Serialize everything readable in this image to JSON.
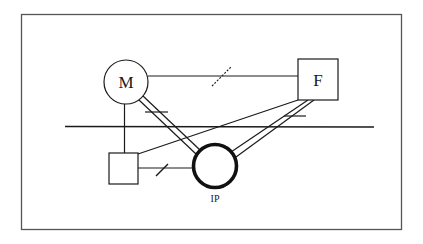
{
  "diagram": {
    "nodes": [
      {
        "id": "M",
        "label": "M",
        "shape": "circle"
      },
      {
        "id": "F",
        "label": "F",
        "shape": "square"
      },
      {
        "id": "S",
        "label": "",
        "shape": "square"
      },
      {
        "id": "IP",
        "label": "IP",
        "shape": "circle-bold",
        "caption": "IP"
      }
    ],
    "edges": [
      {
        "from": "M",
        "to": "F",
        "style": "single",
        "mark": "dashed-slash"
      },
      {
        "from": "M",
        "to": "S",
        "style": "single"
      },
      {
        "from": "M",
        "to": "IP",
        "style": "double",
        "mark": "bar"
      },
      {
        "from": "F",
        "to": "IP",
        "style": "double",
        "mark": "bar"
      },
      {
        "from": "F",
        "to": "S",
        "style": "single"
      },
      {
        "from": "S",
        "to": "IP",
        "style": "single",
        "mark": "slash"
      }
    ],
    "boundary_line": "horizontal divider",
    "colors": {
      "stroke": "#1a1a1a",
      "frame": "#555555",
      "background": "#ffffff"
    }
  }
}
